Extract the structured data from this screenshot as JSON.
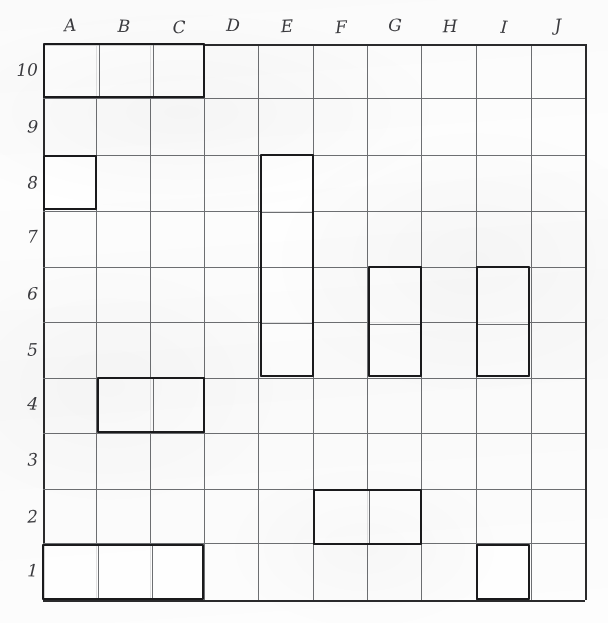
{
  "worksheet": {
    "title": "Grid worksheet",
    "description": "Hand-drawn 10 by 10 lettered and numbered grid with outlined rectangular regions"
  },
  "grid": {
    "columns": [
      "A",
      "B",
      "C",
      "D",
      "E",
      "F",
      "G",
      "H",
      "I",
      "J"
    ],
    "rows": [
      "10",
      "9",
      "8",
      "7",
      "6",
      "5",
      "4",
      "3",
      "2",
      "1"
    ],
    "column_count": 10,
    "row_count": 10,
    "origin_x": 43,
    "origin_y": 44,
    "cell_width": 54.2,
    "cell_height": 55.6,
    "line_color": "#6d6f72",
    "border_color": "#2a2a2c",
    "background_color": "#fdfdfd"
  },
  "regions": [
    {
      "id": "region-a10-c10",
      "label": "A10:C10",
      "col_start": "A",
      "col_end": "C",
      "row_top": "10",
      "row_bottom": "10",
      "col_index": 0,
      "row_index": 0,
      "width_cells": 3,
      "height_cells": 1,
      "area_cells": 3,
      "outline_color": "#1a1a1c"
    },
    {
      "id": "region-a8",
      "label": "A8",
      "col_start": "A",
      "col_end": "A",
      "row_top": "8",
      "row_bottom": "8",
      "col_index": 0,
      "row_index": 2,
      "width_cells": 1,
      "height_cells": 1,
      "area_cells": 1,
      "outline_color": "#1a1a1c"
    },
    {
      "id": "region-e8-e5",
      "label": "E8:E5",
      "col_start": "E",
      "col_end": "E",
      "row_top": "8",
      "row_bottom": "5",
      "col_index": 4,
      "row_index": 2,
      "width_cells": 1,
      "height_cells": 4,
      "area_cells": 4,
      "outline_color": "#1a1a1c"
    },
    {
      "id": "region-g6-g5",
      "label": "G6:G5",
      "col_start": "G",
      "col_end": "G",
      "row_top": "6",
      "row_bottom": "5",
      "col_index": 6,
      "row_index": 4,
      "width_cells": 1,
      "height_cells": 2,
      "area_cells": 2,
      "outline_color": "#1a1a1c"
    },
    {
      "id": "region-i6-i5",
      "label": "I6:I5",
      "col_start": "I",
      "col_end": "I",
      "row_top": "6",
      "row_bottom": "5",
      "col_index": 8,
      "row_index": 4,
      "width_cells": 1,
      "height_cells": 2,
      "area_cells": 2,
      "outline_color": "#1a1a1c"
    },
    {
      "id": "region-b4-c4",
      "label": "B4:C4",
      "col_start": "B",
      "col_end": "C",
      "row_top": "4",
      "row_bottom": "4",
      "col_index": 1,
      "row_index": 6,
      "width_cells": 2,
      "height_cells": 1,
      "area_cells": 2,
      "outline_color": "#1a1a1c"
    },
    {
      "id": "region-f2-g2",
      "label": "F2:G2",
      "col_start": "F",
      "col_end": "G",
      "row_top": "2",
      "row_bottom": "2",
      "col_index": 5,
      "row_index": 8,
      "width_cells": 2,
      "height_cells": 1,
      "area_cells": 2,
      "outline_color": "#1a1a1c"
    },
    {
      "id": "region-a1-c1",
      "label": "A1:C1",
      "col_start": "A",
      "col_end": "C",
      "row_top": "1",
      "row_bottom": "1",
      "col_index": 0,
      "row_index": 9,
      "width_cells": 3,
      "height_cells": 1,
      "area_cells": 3,
      "outline_color": "#1a1a1c"
    },
    {
      "id": "region-i1",
      "label": "I1",
      "col_start": "I",
      "col_end": "I",
      "row_top": "1",
      "row_bottom": "1",
      "col_index": 8,
      "row_index": 9,
      "width_cells": 1,
      "height_cells": 1,
      "area_cells": 1,
      "outline_color": "#1a1a1c"
    }
  ]
}
